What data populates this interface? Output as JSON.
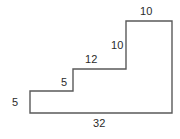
{
  "figure": {
    "name": "staircase-polygon-dimension-diagram",
    "type": "geometric-outline",
    "stroke_color": "#5a5a5a",
    "fill_color": "#ffffff",
    "text_color": "#2b2b2b",
    "stroke_width": 1.4,
    "canvas": {
      "width": 180,
      "height": 139
    }
  },
  "shape": {
    "description": "Closed staircase-shaped polygon with three rising steps from lower-left to upper-right",
    "vertices": [
      {
        "id": "v1",
        "x": 30,
        "y": 91
      },
      {
        "id": "v2",
        "x": 73,
        "y": 91
      },
      {
        "id": "v3",
        "x": 73,
        "y": 69
      },
      {
        "id": "v4",
        "x": 126,
        "y": 69
      },
      {
        "id": "v5",
        "x": 126,
        "y": 21
      },
      {
        "id": "v6",
        "x": 172,
        "y": 21
      },
      {
        "id": "v7",
        "x": 172,
        "y": 113
      },
      {
        "id": "v8",
        "x": 30,
        "y": 113
      }
    ],
    "path": "M 30 91 L 73 91 L 73 69 L 126 69 L 126 21 L 172 21 L 172 113 L 30 113 Z"
  },
  "labels": [
    {
      "id": "top-edge",
      "text": "10",
      "edge": "v5-v6",
      "orientation": "horizontal",
      "position": "above",
      "x": 140,
      "y": 5
    },
    {
      "id": "upper-riser",
      "text": "10",
      "edge": "v4-v5",
      "orientation": "vertical",
      "position": "left",
      "x": 111,
      "y": 39
    },
    {
      "id": "middle-tread",
      "text": "12",
      "edge": "v3-v4",
      "orientation": "horizontal",
      "position": "above",
      "x": 85,
      "y": 53
    },
    {
      "id": "lower-tread",
      "text": "5",
      "edge": "v2-v3",
      "orientation": "horizontal",
      "position": "above",
      "x": 61,
      "y": 76
    },
    {
      "id": "left-riser",
      "text": "5",
      "edge": "v1-v8",
      "orientation": "vertical",
      "position": "left",
      "x": 12,
      "y": 96
    },
    {
      "id": "bottom-edge",
      "text": "32",
      "edge": "v7-v8",
      "orientation": "horizontal",
      "position": "below",
      "x": 93,
      "y": 117
    }
  ],
  "chart_data": {
    "type": "table",
    "title": "",
    "categories": [
      "top-edge",
      "upper-riser",
      "middle-tread",
      "lower-tread",
      "left-riser",
      "bottom-edge"
    ],
    "values": [
      10,
      10,
      12,
      5,
      5,
      32
    ]
  }
}
